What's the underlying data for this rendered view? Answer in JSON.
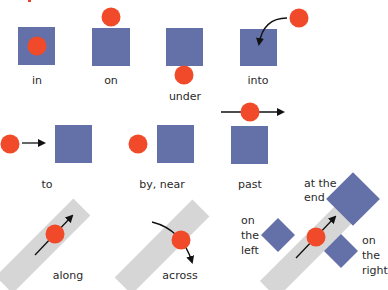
{
  "title_fragment": "prepositions",
  "colors": {
    "square": "#6470a8",
    "ball": "#f04a2a",
    "track": "#d6d6d6",
    "arrow": "#111111",
    "title": "#e8422a"
  },
  "row1": {
    "in": "in",
    "on": "on",
    "under": "under",
    "into": "into"
  },
  "row2": {
    "to": "to",
    "by_near": "by, near",
    "past": "past"
  },
  "row3": {
    "along": "along",
    "across": "across",
    "at_the_end": [
      "at the",
      "end"
    ],
    "on_the_left": [
      "on",
      "the",
      "left"
    ],
    "on_the_right": [
      "on",
      "the",
      "right"
    ]
  }
}
